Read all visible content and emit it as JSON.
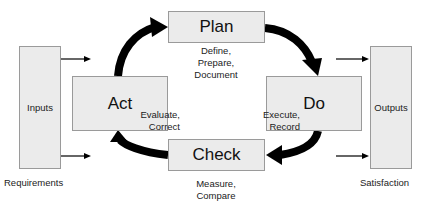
{
  "diagram": {
    "stages": {
      "plan": {
        "label": "Plan",
        "caption": [
          "Define,",
          "Prepare,",
          "Document"
        ]
      },
      "do": {
        "label": "Do",
        "caption": [
          "Execute,",
          "Record"
        ]
      },
      "check": {
        "label": "Check",
        "caption": [
          "Measure,",
          "Compare"
        ]
      },
      "act": {
        "label": "Act",
        "caption": [
          "Evaluate,",
          "Correct"
        ]
      }
    },
    "inputs": {
      "label": "Inputs",
      "caption": "Requirements"
    },
    "outputs": {
      "label": "Outputs",
      "caption": "Satisfaction"
    },
    "flow": [
      "Plan",
      "Do",
      "Check",
      "Act",
      "Plan"
    ],
    "colors": {
      "box_fill": "#ebebeb",
      "box_border": "#9a9a9a",
      "arrow": "#000000"
    }
  }
}
